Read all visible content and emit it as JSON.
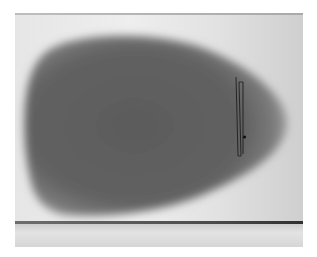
{
  "image": {
    "description": "Grayscale radiograph of a rounded, egg-shaped dark object on a light background with a thin vertical two-wire marker near its narrow right end",
    "colors": {
      "background": "#e8e8e8",
      "object_core": "#5e5e5e",
      "object_edge": "#9a9a9a",
      "marker": "#1e1e1e",
      "bottom_line": "#3a3a3a"
    }
  }
}
